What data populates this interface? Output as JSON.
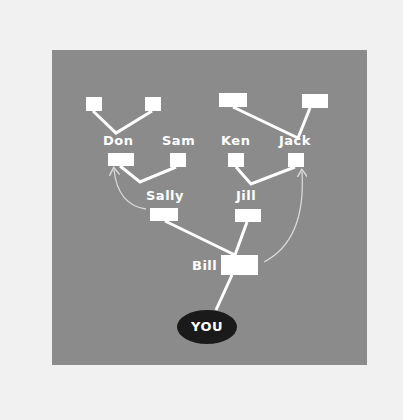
{
  "diagram": {
    "type": "family-tree",
    "colors": {
      "background": "#f1f1f1",
      "panel": "#8b8b8b",
      "node": "#ffffff",
      "you_node": "#1a1a1a",
      "line": "#ffffff",
      "arrow": "#d8d8d8"
    },
    "nodes": [
      {
        "id": "you",
        "label": "YOU"
      },
      {
        "id": "bill",
        "label": "Bill"
      },
      {
        "id": "sally",
        "label": "Sally"
      },
      {
        "id": "jill",
        "label": "Jill"
      },
      {
        "id": "don",
        "label": "Don"
      },
      {
        "id": "sam",
        "label": "Sam"
      },
      {
        "id": "ken",
        "label": "Ken"
      },
      {
        "id": "jack",
        "label": "Jack"
      },
      {
        "id": "don_parent_1",
        "label": ""
      },
      {
        "id": "don_parent_2",
        "label": ""
      },
      {
        "id": "jack_parent_1",
        "label": ""
      },
      {
        "id": "jack_parent_2",
        "label": ""
      }
    ],
    "edges": [
      [
        "you",
        "bill"
      ],
      [
        "bill",
        "sally"
      ],
      [
        "bill",
        "jill"
      ],
      [
        "sally",
        "don"
      ],
      [
        "sally",
        "sam"
      ],
      [
        "jill",
        "ken"
      ],
      [
        "jill",
        "jack"
      ],
      [
        "don",
        "don_parent_1"
      ],
      [
        "don",
        "don_parent_2"
      ],
      [
        "jack",
        "jack_parent_1"
      ],
      [
        "jack",
        "jack_parent_2"
      ]
    ],
    "arrows": [
      {
        "from": "sally",
        "to": "don"
      },
      {
        "from": "bill",
        "to": "jack"
      }
    ],
    "labels": {
      "you": "YOU",
      "bill": "Bill",
      "sally": "Sally",
      "jill": "Jill",
      "don": "Don",
      "sam": "Sam",
      "ken": "Ken",
      "jack": "Jack"
    }
  }
}
